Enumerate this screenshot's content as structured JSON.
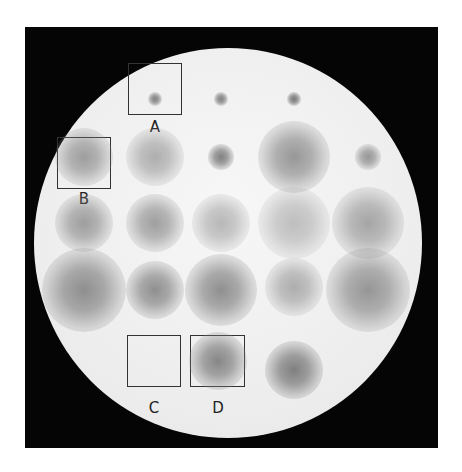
{
  "image": {
    "description": "Circular plate assay with a grid of diffuse grey zones of varying size and intensity; four regions marked with boxes and letter labels",
    "colors": {
      "frame": "#050505",
      "plate": "#eeeeee",
      "spot": "#6e6e6e",
      "box_border": "#333333",
      "background": "#ffffff"
    }
  },
  "spots": [
    {
      "id": "r1c2",
      "row": 1,
      "col": 2,
      "size": "tiny",
      "intensity": 0.75
    },
    {
      "id": "r1c3",
      "row": 1,
      "col": 3,
      "size": "tiny",
      "intensity": 0.75
    },
    {
      "id": "r1c4",
      "row": 1,
      "col": 4,
      "size": "tiny",
      "intensity": 0.8
    },
    {
      "id": "r2c1",
      "row": 2,
      "col": 1,
      "size": "medium",
      "intensity": 0.55
    },
    {
      "id": "r2c2",
      "row": 2,
      "col": 2,
      "size": "medium",
      "intensity": 0.45
    },
    {
      "id": "r2c3",
      "row": 2,
      "col": 3,
      "size": "small",
      "intensity": 0.75
    },
    {
      "id": "r2c4",
      "row": 2,
      "col": 4,
      "size": "large",
      "intensity": 0.6
    },
    {
      "id": "r2c5",
      "row": 2,
      "col": 5,
      "size": "small",
      "intensity": 0.6
    },
    {
      "id": "r3c1",
      "row": 3,
      "col": 1,
      "size": "medium",
      "intensity": 0.55
    },
    {
      "id": "r3c2",
      "row": 3,
      "col": 2,
      "size": "medium",
      "intensity": 0.55
    },
    {
      "id": "r3c3",
      "row": 3,
      "col": 3,
      "size": "medium",
      "intensity": 0.4
    },
    {
      "id": "r3c4",
      "row": 3,
      "col": 4,
      "size": "large",
      "intensity": 0.35
    },
    {
      "id": "r3c5",
      "row": 3,
      "col": 5,
      "size": "large",
      "intensity": 0.5
    },
    {
      "id": "r4c1",
      "row": 4,
      "col": 1,
      "size": "xlarge",
      "intensity": 0.65
    },
    {
      "id": "r4c2",
      "row": 4,
      "col": 2,
      "size": "medium",
      "intensity": 0.65
    },
    {
      "id": "r4c3",
      "row": 4,
      "col": 3,
      "size": "large",
      "intensity": 0.65
    },
    {
      "id": "r4c4",
      "row": 4,
      "col": 4,
      "size": "medium",
      "intensity": 0.45
    },
    {
      "id": "r4c5",
      "row": 4,
      "col": 5,
      "size": "xlarge",
      "intensity": 0.6
    },
    {
      "id": "r5c3",
      "row": 5,
      "col": 3,
      "size": "medium",
      "intensity": 0.7
    },
    {
      "id": "r5c4",
      "row": 5,
      "col": 4,
      "size": "medium",
      "intensity": 0.75
    }
  ],
  "labels": {
    "a": "A",
    "b": "B",
    "c": "C",
    "d": "D"
  }
}
